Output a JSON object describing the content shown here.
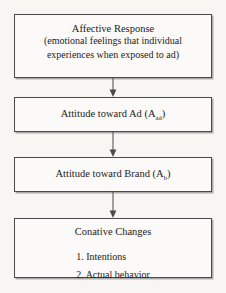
{
  "diagram": {
    "type": "flowchart-vertical",
    "background_color": "#f7f6f3",
    "box_border_color": "#4a4a4a",
    "box_fill_color": "#fbfaf8",
    "boxes": [
      {
        "id": "affective-response",
        "title": "Affective Response",
        "line2": "(emotional feelings that individual",
        "line3": "experiences when exposed to ad)"
      },
      {
        "id": "attitude-toward-ad",
        "text_before": "Attitude toward Ad (A",
        "subscript": "ad",
        "text_after": ")"
      },
      {
        "id": "attitude-toward-brand",
        "text_before": "Attitude toward Brand (A",
        "subscript": "b",
        "text_after": ")"
      },
      {
        "id": "conative-changes",
        "title": "Conative Changes",
        "items": [
          "1. Intentions",
          "2. Actual behavior"
        ]
      }
    ],
    "connectors": [
      {
        "id": "arrow-1",
        "from": "affective-response",
        "to": "attitude-toward-ad",
        "direction": "down"
      },
      {
        "id": "arrow-2",
        "from": "attitude-toward-ad",
        "to": "attitude-toward-brand",
        "direction": "down"
      },
      {
        "id": "arrow-3",
        "from": "attitude-toward-brand",
        "to": "conative-changes",
        "direction": "down"
      }
    ]
  }
}
